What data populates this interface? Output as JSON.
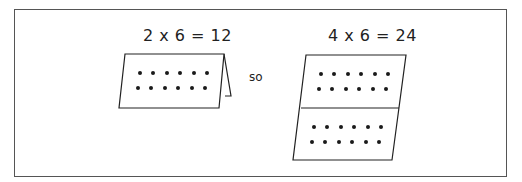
{
  "left": {
    "equation": "2 x 6 = 12",
    "rows": 2,
    "cols": 6,
    "product": 12
  },
  "connector": "so",
  "right": {
    "equation": "4 x 6 = 24",
    "panels": 2,
    "rows_per_panel": 2,
    "cols": 6,
    "product": 24
  },
  "colors": {
    "line": "#222222",
    "dot": "#1a1a1a",
    "border": "#555555"
  }
}
